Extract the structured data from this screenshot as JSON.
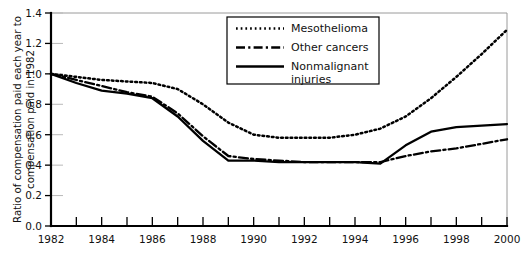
{
  "chart_data": {
    "type": "line",
    "title": "",
    "xlabel": "",
    "ylabel": "Ratio of compensation paid each year to compensation paid in 1982",
    "xlim": [
      1982,
      2000
    ],
    "ylim": [
      0.0,
      1.4
    ],
    "grid": false,
    "legend_position": "top-center",
    "x": [
      1982,
      1983,
      1984,
      1985,
      1986,
      1987,
      1988,
      1989,
      1990,
      1991,
      1992,
      1993,
      1994,
      1995,
      1996,
      1997,
      1998,
      1999,
      2000
    ],
    "x_tick_labels": [
      "1982",
      "1984",
      "1986",
      "1988",
      "1990",
      "1992",
      "1994",
      "1996",
      "1998",
      "2000"
    ],
    "x_tick_values": [
      1982,
      1984,
      1986,
      1988,
      1990,
      1992,
      1994,
      1996,
      1998,
      2000
    ],
    "y_tick_labels": [
      "0.0",
      "0.2",
      "0.4",
      "0.6",
      "0.8",
      "1.0",
      "1.2",
      "1.4"
    ],
    "y_tick_values": [
      0.0,
      0.2,
      0.4,
      0.6,
      0.8,
      1.0,
      1.2,
      1.4
    ],
    "series": [
      {
        "name": "Mesothelioma",
        "style": "dotted",
        "values": [
          1.0,
          0.98,
          0.96,
          0.95,
          0.94,
          0.9,
          0.8,
          0.68,
          0.6,
          0.58,
          0.58,
          0.58,
          0.6,
          0.64,
          0.72,
          0.84,
          0.98,
          1.13,
          1.29
        ]
      },
      {
        "name": "Other cancers",
        "style": "dash-dot",
        "values": [
          1.0,
          0.96,
          0.92,
          0.88,
          0.85,
          0.74,
          0.59,
          0.46,
          0.44,
          0.43,
          0.42,
          0.42,
          0.42,
          0.42,
          0.46,
          0.49,
          0.51,
          0.54,
          0.57
        ]
      },
      {
        "name": "Nonmalignant injuries",
        "style": "solid",
        "values": [
          1.0,
          0.94,
          0.89,
          0.87,
          0.84,
          0.72,
          0.56,
          0.43,
          0.43,
          0.42,
          0.42,
          0.42,
          0.42,
          0.41,
          0.53,
          0.62,
          0.65,
          0.66,
          0.67
        ]
      }
    ]
  },
  "legend": {
    "items": [
      {
        "label": "Mesothelioma",
        "style": "dotted"
      },
      {
        "label": "Other cancers",
        "style": "dash-dot"
      },
      {
        "label_line1": "Nonmalignant",
        "label_line2": "injuries",
        "style": "solid"
      }
    ]
  },
  "colors": {
    "ink": "#000000",
    "frame": "#9a9a9a",
    "background": "#ffffff"
  }
}
